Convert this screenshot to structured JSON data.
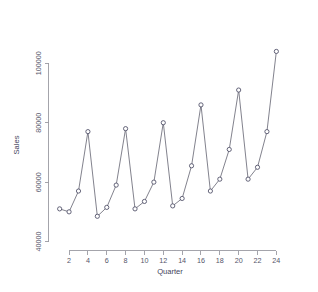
{
  "chart_data": {
    "type": "line",
    "title": "",
    "subtitle": "",
    "xlabel": "Quarter",
    "ylabel": "Sales",
    "grid": false,
    "legend": null,
    "marker": "open-circle",
    "x": [
      1,
      2,
      3,
      4,
      5,
      6,
      7,
      8,
      9,
      10,
      11,
      12,
      13,
      14,
      15,
      16,
      17,
      18,
      19,
      20,
      21,
      22,
      23,
      24
    ],
    "values": [
      51000,
      50000,
      57000,
      77000,
      48500,
      51500,
      59000,
      78000,
      51000,
      53500,
      60000,
      80000,
      52000,
      54500,
      65500,
      86000,
      57000,
      61000,
      71000,
      91000,
      61000,
      65000,
      77000,
      104000
    ],
    "series": [
      {
        "name": "Sales",
        "values": [
          51000,
          50000,
          57000,
          77000,
          48500,
          51500,
          59000,
          78000,
          51000,
          53500,
          60000,
          80000,
          52000,
          54500,
          65500,
          86000,
          57000,
          61000,
          71000,
          91000,
          61000,
          65000,
          77000,
          104000
        ]
      }
    ],
    "xlim": [
      0.4,
      24.6
    ],
    "ylim": [
      38500,
      106500
    ],
    "x_ticks": [
      2,
      4,
      6,
      8,
      10,
      12,
      14,
      16,
      18,
      20,
      22,
      24
    ],
    "x_tick_labels": [
      "2",
      "4",
      "6",
      "8",
      "10",
      "12",
      "14",
      "16",
      "18",
      "20",
      "22",
      "24"
    ],
    "y_ticks": [
      40000,
      60000,
      80000,
      100000
    ],
    "y_tick_labels": [
      "40000",
      "60000",
      "80000",
      "100000"
    ],
    "colors": {
      "line": "#6b6b78",
      "marker_stroke": "#4a4a63",
      "marker_fill": "#ffffff",
      "axis": "#9a9aa2",
      "tick_label": "#55556a",
      "axis_title": "#44445c",
      "background": "#ffffff"
    }
  }
}
